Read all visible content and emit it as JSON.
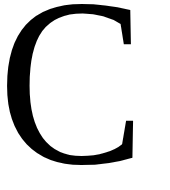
{
  "glyph": {
    "character": "C",
    "color": "#000000"
  },
  "background": "#ffffff"
}
